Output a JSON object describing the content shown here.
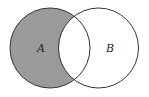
{
  "diagram": {
    "type": "venn",
    "sets": [
      {
        "name": "A",
        "label": "A",
        "cx": 50,
        "cy": 48,
        "r": 40
      },
      {
        "name": "B",
        "label": "B",
        "cx": 98.5,
        "cy": 48,
        "r": 40
      }
    ],
    "shaded_region": "A minus B",
    "colors": {
      "fill": "#9a9a9a",
      "stroke": "#333333",
      "background": "#ffffff"
    }
  }
}
